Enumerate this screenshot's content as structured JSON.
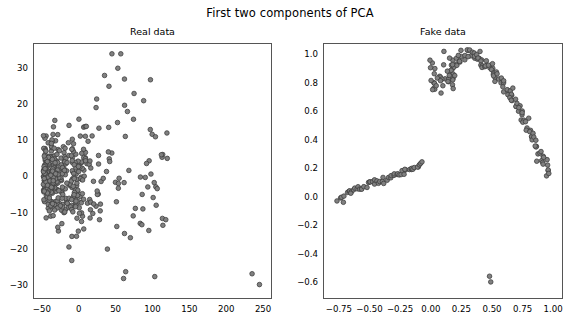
{
  "figure": {
    "suptitle": "First two components of PCA",
    "background": "#ffffff",
    "marker_face": "#808080",
    "marker_edge": "#3f3f3f",
    "frame_color": "#555555"
  },
  "chart_data": [
    {
      "type": "scatter",
      "title": "Real data",
      "xlabel": "",
      "ylabel": "",
      "xlim": [
        -62,
        262
      ],
      "ylim": [
        -34,
        37
      ],
      "xticks": [
        -50,
        0,
        50,
        100,
        150,
        200,
        250
      ],
      "xticklabels": [
        "-50",
        "0",
        "50",
        "100",
        "150",
        "200",
        "250"
      ],
      "yticks": [
        -30,
        -20,
        -10,
        0,
        10,
        20,
        30
      ],
      "yticklabels": [
        "-30",
        "-20",
        "-10",
        "0",
        "10",
        "20",
        "30"
      ],
      "grid": false,
      "legend": null,
      "marker": "circle",
      "marker_size": 4.6,
      "description": "Dense cone-shaped cloud concentrated near x=-45..10 centered on y=0, fanning out to the right with sparse outliers; two high points near (45,34) and (57,34); two far-right low outliers near (235,-27) and (245,-30).",
      "n_points": 420,
      "generator": {
        "mode": "real",
        "seed": 20240517,
        "core": {
          "n": 300,
          "x_min": -48,
          "x_decay": 22,
          "y_sigma_base": 4.2,
          "y_sigma_growth": 0.085
        },
        "fan": {
          "n": 100,
          "x_min": -10,
          "x_max": 120,
          "y_sigma_base": 6.0,
          "y_sigma_growth": 0.1
        },
        "outliers": [
          [
            45,
            34
          ],
          [
            57,
            34
          ],
          [
            62,
            27
          ],
          [
            75,
            23
          ],
          [
            88,
            21
          ],
          [
            97,
            13
          ],
          [
            104,
            11
          ],
          [
            112,
            6
          ],
          [
            120,
            5
          ],
          [
            86,
            -5
          ],
          [
            105,
            -8
          ],
          [
            118,
            -12
          ],
          [
            95,
            -15
          ],
          [
            70,
            -17
          ],
          [
            235,
            -27
          ],
          [
            245,
            -30
          ],
          [
            53,
            30
          ],
          [
            41,
            25
          ],
          [
            35,
            28
          ],
          [
            66,
            18
          ]
        ]
      }
    },
    {
      "type": "scatter",
      "title": "Fake data",
      "xlabel": "",
      "ylabel": "",
      "xlim": [
        -0.88,
        1.08
      ],
      "ylim": [
        -0.72,
        1.08
      ],
      "xticks": [
        -0.75,
        -0.5,
        -0.25,
        0.0,
        0.25,
        0.5,
        0.75,
        1.0
      ],
      "xticklabels": [
        "-0.75",
        "-0.50",
        "-0.25",
        "0.00",
        "0.25",
        "0.50",
        "0.75",
        "1.00"
      ],
      "yticks": [
        -0.6,
        -0.4,
        -0.2,
        0.0,
        0.2,
        0.4,
        0.6,
        0.8,
        1.0
      ],
      "yticklabels": [
        "-0.6",
        "-0.4",
        "-0.2",
        "0.0",
        "0.2",
        "0.4",
        "0.6",
        "0.8",
        "1.0"
      ],
      "grid": false,
      "legend": null,
      "marker": "circle",
      "marker_size": 4.6,
      "description": "Thin linear band from (-0.75,0.00) to (-0.08,0.24); an arc peaking near (0.30,1.00) that descends steeply to (0.97,0.13); a small scattered group near (0.02..0.20, 0.80..0.92); two isolated outliers near (0.48,-0.56) and (0.49,-0.60).",
      "n_points": 205,
      "generator": {
        "mode": "fake",
        "seed": 987654,
        "line": {
          "n": 55,
          "x_min": -0.76,
          "x_max": -0.06,
          "slope": 0.335,
          "intercept": 0.252,
          "noise": 0.016
        },
        "arc": {
          "n": 110,
          "t_min": 0.0,
          "t_max": 1.0,
          "x_min": 0.16,
          "x_max": 0.98,
          "peak_x": 0.33,
          "peak_y": 1.0,
          "end_y": 0.13,
          "noise_x": 0.012,
          "noise_y": 0.022
        },
        "blob": {
          "n": 38,
          "x_center": 0.11,
          "x_spread": 0.12,
          "y_center": 0.86,
          "y_spread": 0.055
        },
        "outliers": [
          [
            0.48,
            -0.56
          ],
          [
            0.49,
            -0.6
          ]
        ]
      }
    }
  ]
}
